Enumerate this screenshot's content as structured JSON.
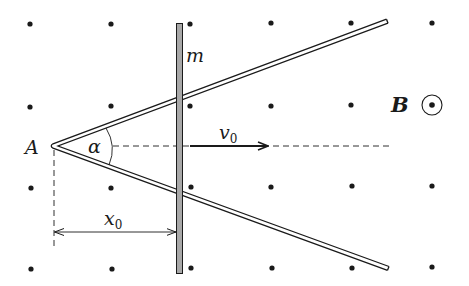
{
  "diagram": {
    "labels": {
      "apex": "A",
      "angle": "α",
      "rod_mass": "m",
      "velocity": "v",
      "velocity_sub": "0",
      "distance": "x",
      "distance_sub": "0",
      "field": "B"
    },
    "field_direction": "out-of-page",
    "field_symbol": "dot-in-circle",
    "dot_grid": {
      "rows_y": [
        24,
        106,
        187,
        268
      ],
      "cols_x": [
        30,
        111,
        190,
        271,
        351,
        432
      ]
    },
    "colors": {
      "ink": "#1a1a1a",
      "rod_fill": "#a8a8a8",
      "background": "#ffffff"
    }
  }
}
